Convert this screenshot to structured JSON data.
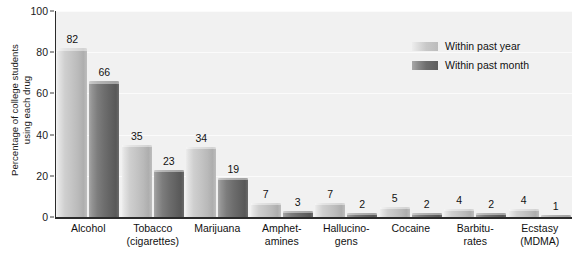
{
  "chart_data": {
    "type": "bar",
    "title": "",
    "xlabel": "",
    "ylabel": "Percentage of college students using each drug",
    "ylabel_lines": [
      "Percentage of college students",
      "using each drug"
    ],
    "ylim": [
      0,
      100
    ],
    "yticks": [
      0,
      20,
      40,
      60,
      80,
      100
    ],
    "grid": true,
    "legend_position": "upper-right-inside",
    "categories": [
      "Alcohol",
      "Tobacco (cigarettes)",
      "Marijuana",
      "Amphetamines",
      "Hallucinogens",
      "Cocaine",
      "Barbiturates",
      "Ecstasy (MDMA)"
    ],
    "category_lines": [
      [
        "Alcohol"
      ],
      [
        "Tobacco",
        "(cigarettes)"
      ],
      [
        "Marijuana"
      ],
      [
        "Amphet-",
        "amines"
      ],
      [
        "Hallucino-",
        "gens"
      ],
      [
        "Cocaine"
      ],
      [
        "Barbitu-",
        "rates"
      ],
      [
        "Ecstasy",
        "(MDMA)"
      ]
    ],
    "series": [
      {
        "name": "Within past year",
        "color": "#c4c4c4",
        "values": [
          82,
          35,
          34,
          7,
          7,
          5,
          4,
          4
        ]
      },
      {
        "name": "Within past month",
        "color": "#6e6e6e",
        "values": [
          66,
          23,
          19,
          3,
          2,
          2,
          2,
          1
        ]
      }
    ]
  },
  "legend": {
    "items": [
      {
        "label": "Within past year",
        "swatch": "light"
      },
      {
        "label": "Within past month",
        "swatch": "dark"
      }
    ]
  },
  "colors": {
    "plot_background": "#f1f1f1",
    "page_background": "#ffffff",
    "axis": "#2b2b2b",
    "gridline": "#fbfbfb",
    "text": "#111111",
    "bar_light": "#c4c4c4",
    "bar_dark": "#6e6e6e"
  }
}
